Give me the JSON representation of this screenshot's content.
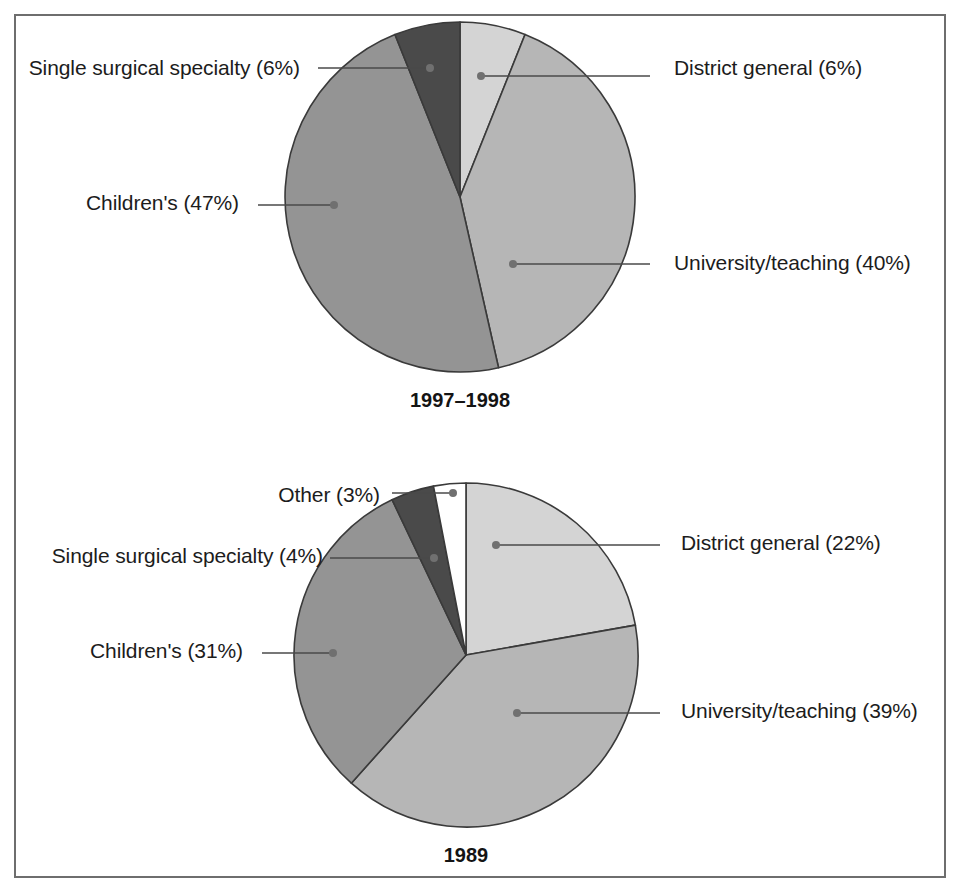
{
  "figure": {
    "width": 962,
    "height": 893,
    "background": "#ffffff",
    "frame_color": "#6e6e6e"
  },
  "palette": {
    "district_general": "#d4d4d4",
    "university_teaching": "#b6b6b6",
    "childrens": "#949494",
    "single_surgical_specialty": "#4a4a4a",
    "other": "#ffffff",
    "slice_outline": "#3a3a3a",
    "leader_line": "#4a4a4a",
    "leader_dot": "#707070",
    "text": "#1c1c1c"
  },
  "chart_data": [
    {
      "type": "pie",
      "title": "1997–1998",
      "id": "pie-1997-1998",
      "center": {
        "x": 460,
        "y": 197
      },
      "radius": 175,
      "start_angle_deg": 0,
      "direction": "clockwise",
      "legend": "callout-labels",
      "categories": [
        "District general",
        "University/teaching",
        "Children's",
        "Single surgical specialty"
      ],
      "values": [
        6,
        40,
        47,
        6
      ],
      "slices": [
        {
          "label": "District general (6%)",
          "name": "District general",
          "value": 6,
          "color": "#d4d4d4",
          "label_side": "right",
          "label_x": 674,
          "label_y": 70,
          "dot_x": 481,
          "dot_y": 76,
          "elbow_x": 650,
          "elbow_y": 76
        },
        {
          "label": "University/teaching (40%)",
          "name": "University/teaching",
          "value": 40,
          "color": "#b6b6b6",
          "label_side": "right",
          "label_x": 674,
          "label_y": 265,
          "dot_x": 513,
          "dot_y": 264,
          "elbow_x": 650,
          "elbow_y": 264
        },
        {
          "label": "Children's (47%)",
          "name": "Children's",
          "value": 47,
          "color": "#949494",
          "label_side": "left",
          "label_x": 239,
          "label_y": 205,
          "dot_x": 334,
          "dot_y": 205,
          "elbow_x": 258,
          "elbow_y": 205
        },
        {
          "label": "Single surgical specialty (6%)",
          "name": "Single surgical specialty",
          "value": 6,
          "color": "#4a4a4a",
          "label_side": "left",
          "label_x": 300,
          "label_y": 70,
          "dot_x": 430,
          "dot_y": 68,
          "elbow_x": 318,
          "elbow_y": 68
        }
      ]
    },
    {
      "type": "pie",
      "title": "1989",
      "id": "pie-1989",
      "center": {
        "x": 466,
        "y": 655
      },
      "radius": 172,
      "start_angle_deg": 0,
      "direction": "clockwise",
      "legend": "callout-labels",
      "categories": [
        "District general",
        "University/teaching",
        "Children's",
        "Single surgical specialty",
        "Other"
      ],
      "values": [
        22,
        39,
        31,
        4,
        3
      ],
      "slices": [
        {
          "label": "District general (22%)",
          "name": "District general",
          "value": 22,
          "color": "#d4d4d4",
          "label_side": "right",
          "label_x": 681,
          "label_y": 545,
          "dot_x": 496,
          "dot_y": 545,
          "elbow_x": 660,
          "elbow_y": 545
        },
        {
          "label": "University/teaching (39%)",
          "name": "University/teaching",
          "value": 39,
          "color": "#b6b6b6",
          "label_side": "right",
          "label_x": 681,
          "label_y": 713,
          "dot_x": 517,
          "dot_y": 713,
          "elbow_x": 660,
          "elbow_y": 713
        },
        {
          "label": "Children's (31%)",
          "name": "Children's",
          "value": 31,
          "color": "#949494",
          "label_side": "left",
          "label_x": 243,
          "label_y": 653,
          "dot_x": 333,
          "dot_y": 653,
          "elbow_x": 262,
          "elbow_y": 653
        },
        {
          "label": "Single surgical specialty (4%)",
          "name": "Single surgical specialty",
          "value": 4,
          "color": "#4a4a4a",
          "label_side": "left",
          "label_x": 323,
          "label_y": 558,
          "dot_x": 434,
          "dot_y": 558,
          "elbow_x": 330,
          "elbow_y": 558
        },
        {
          "label": "Other (3%)",
          "name": "Other",
          "value": 3,
          "color": "#ffffff",
          "label_side": "left",
          "label_x": 380,
          "label_y": 497,
          "dot_x": 453,
          "dot_y": 493,
          "elbow_x": 392,
          "elbow_y": 493
        }
      ]
    }
  ]
}
